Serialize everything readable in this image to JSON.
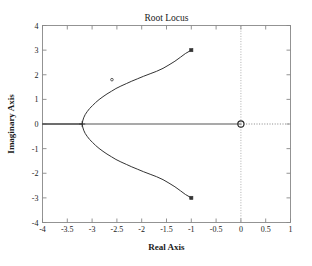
{
  "chart_data": {
    "type": "line",
    "title": "Root Locus",
    "xlabel": "Real Axis",
    "ylabel": "Imaginary Axis",
    "xlim": [
      -4,
      1
    ],
    "ylim": [
      -4,
      4
    ],
    "grid": false,
    "legend": "none",
    "xticks": [
      -4,
      -3.5,
      -3,
      -2.5,
      -2,
      -1.5,
      -1,
      -0.5,
      0,
      0.5,
      1
    ],
    "xticklabels": [
      "-4",
      "-3.5",
      "-3",
      "-2.5",
      "-2",
      "-1.5",
      "-1",
      "-0.5",
      "0",
      "0.5",
      "1"
    ],
    "yticks": [
      -4,
      -3,
      -2,
      -1,
      0,
      1,
      2,
      3,
      4
    ],
    "yticklabels": [
      "-4",
      "-3",
      "-2",
      "-1",
      "0",
      "1",
      "2",
      "3",
      "4"
    ],
    "series": [
      {
        "name": "root-locus-upper-branch",
        "points": [
          [
            -3.2,
            0.0
          ],
          [
            -3.19,
            0.12
          ],
          [
            -3.17,
            0.25
          ],
          [
            -3.14,
            0.38
          ],
          [
            -3.1,
            0.5
          ],
          [
            -3.05,
            0.63
          ],
          [
            -2.99,
            0.75
          ],
          [
            -2.93,
            0.87
          ],
          [
            -2.86,
            0.99
          ],
          [
            -2.78,
            1.11
          ],
          [
            -2.7,
            1.22
          ],
          [
            -2.61,
            1.33
          ],
          [
            -2.52,
            1.44
          ],
          [
            -2.42,
            1.54
          ],
          [
            -2.31,
            1.64
          ],
          [
            -2.2,
            1.74
          ],
          [
            -2.08,
            1.84
          ],
          [
            -1.96,
            1.94
          ],
          [
            -1.83,
            2.04
          ],
          [
            -1.7,
            2.14
          ],
          [
            -1.57,
            2.26
          ],
          [
            -1.45,
            2.4
          ],
          [
            -1.33,
            2.55
          ],
          [
            -1.22,
            2.71
          ],
          [
            -1.12,
            2.86
          ],
          [
            -1.0,
            3.0
          ]
        ]
      },
      {
        "name": "root-locus-lower-branch",
        "points": [
          [
            -3.2,
            0.0
          ],
          [
            -3.19,
            -0.12
          ],
          [
            -3.17,
            -0.25
          ],
          [
            -3.14,
            -0.38
          ],
          [
            -3.1,
            -0.5
          ],
          [
            -3.05,
            -0.63
          ],
          [
            -2.99,
            -0.75
          ],
          [
            -2.93,
            -0.87
          ],
          [
            -2.86,
            -0.99
          ],
          [
            -2.78,
            -1.11
          ],
          [
            -2.7,
            -1.22
          ],
          [
            -2.61,
            -1.33
          ],
          [
            -2.52,
            -1.44
          ],
          [
            -2.42,
            -1.54
          ],
          [
            -2.31,
            -1.64
          ],
          [
            -2.2,
            -1.74
          ],
          [
            -2.08,
            -1.84
          ],
          [
            -1.96,
            -1.94
          ],
          [
            -1.83,
            -2.04
          ],
          [
            -1.7,
            -2.14
          ],
          [
            -1.57,
            -2.26
          ],
          [
            -1.45,
            -2.4
          ],
          [
            -1.33,
            -2.55
          ],
          [
            -1.22,
            -2.71
          ],
          [
            -1.12,
            -2.86
          ],
          [
            -1.0,
            -3.0
          ]
        ]
      },
      {
        "name": "real-axis-locus-segment",
        "points": [
          [
            -4.0,
            0.0
          ],
          [
            -3.2,
            0.0
          ]
        ]
      }
    ],
    "markers": [
      {
        "name": "branch-endpoint-upper",
        "shape": "square",
        "x": -1.0,
        "y": 3.0
      },
      {
        "name": "branch-endpoint-lower",
        "shape": "square",
        "x": -1.0,
        "y": -3.0
      },
      {
        "name": "branch-gain-point-upper",
        "shape": "dot",
        "x": -2.6,
        "y": 1.8
      },
      {
        "name": "breakaway-point",
        "shape": "cross",
        "x": -3.2,
        "y": 0.0
      },
      {
        "name": "open-loop-zero-origin",
        "shape": "circle",
        "x": 0.0,
        "y": 0.0
      }
    ],
    "reference_lines": [
      {
        "name": "imaginary-axis-dotted",
        "orientation": "vertical",
        "value": 0,
        "style": "dotted"
      },
      {
        "name": "real-axis-dotted-right",
        "orientation": "horizontal",
        "value": 0,
        "style": "dotted",
        "from": 0,
        "to": 1
      }
    ],
    "colors": {
      "curve": "#333333",
      "axis": "#555555",
      "frame": "#888888",
      "text": "#1a1a1a",
      "background": "#ffffff"
    }
  }
}
